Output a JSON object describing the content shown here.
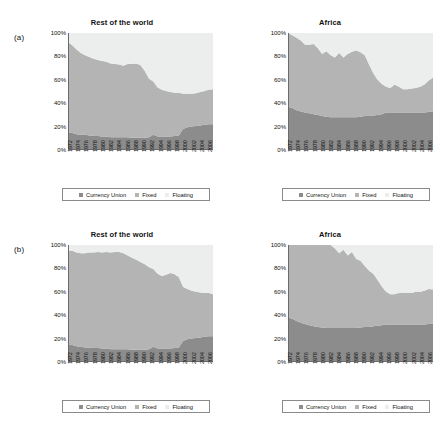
{
  "figure": {
    "panels": [
      {
        "letter": "(a)",
        "title": "Rest of the world",
        "position": "top-left"
      },
      {
        "letter": "",
        "title": "Africa",
        "position": "top-right"
      },
      {
        "letter": "(b)",
        "title": "Rest of the world",
        "position": "bottom-left"
      },
      {
        "letter": "",
        "title": "Africa",
        "position": "bottom-right"
      }
    ],
    "legend": {
      "items": [
        {
          "label": "Currency Union",
          "color": "#8c8c8c",
          "swatch": "square-marker"
        },
        {
          "label": "Fixed",
          "color": "#b4b4b4",
          "swatch": "square-marker"
        },
        {
          "label": "Floating",
          "color": "#eceded",
          "swatch": "square-marker"
        }
      ]
    },
    "yticks": [
      "100%",
      "80%",
      "60%",
      "40%",
      "20%",
      "0%"
    ],
    "xticks": [
      "1972",
      "1974",
      "1976",
      "1978",
      "1980",
      "1982",
      "1984",
      "1986",
      "1988",
      "1990",
      "1992",
      "1994",
      "1996",
      "1998",
      "2000",
      "2002",
      "2004",
      "2006"
    ]
  },
  "chart_data": [
    {
      "id": "panel-a-rest-of-the-world",
      "type": "area",
      "stacked": true,
      "title": "Rest of the world",
      "panel_letter": "(a)",
      "xlabel": "",
      "ylabel": "",
      "ylim": [
        0,
        100
      ],
      "grid": false,
      "legend_position": "bottom",
      "x": [
        1972,
        1973,
        1974,
        1975,
        1976,
        1977,
        1978,
        1979,
        1980,
        1981,
        1982,
        1983,
        1984,
        1985,
        1986,
        1987,
        1988,
        1989,
        1990,
        1991,
        1992,
        1993,
        1994,
        1995,
        1996,
        1997,
        1998,
        1999,
        2000,
        2001,
        2002,
        2003,
        2004,
        2005,
        2006
      ],
      "series": [
        {
          "name": "Currency Union",
          "color": "#8c8c8c",
          "values": [
            15,
            14.5,
            13.5,
            13,
            13,
            12.5,
            12,
            12,
            11.5,
            11.5,
            11,
            11,
            11,
            11,
            11,
            10.5,
            10.5,
            10.5,
            10.5,
            11,
            13,
            11.5,
            11.5,
            11.5,
            11.5,
            12,
            12.5,
            18,
            19.5,
            20,
            20.5,
            21,
            21.5,
            22,
            22
          ]
        },
        {
          "name": "Fixed",
          "color": "#b4b4b4",
          "values": [
            77,
            75,
            72.5,
            70,
            68,
            67,
            66,
            65,
            64.5,
            64,
            63,
            62.5,
            62,
            61,
            62.5,
            63,
            63.5,
            62,
            57,
            50,
            45.5,
            42,
            40,
            39,
            38,
            37,
            36.5,
            30,
            28.5,
            28,
            28,
            28.5,
            29,
            29.5,
            30
          ]
        },
        {
          "name": "Floating",
          "color": "#eceded",
          "values": [
            8,
            10.5,
            14,
            17,
            19,
            20.5,
            22,
            23,
            24,
            24.5,
            26,
            26.5,
            27,
            28,
            26.5,
            26.5,
            26,
            27.5,
            32.5,
            39,
            41.5,
            46.5,
            48.5,
            49.5,
            50.5,
            51,
            51,
            52,
            52,
            52,
            51.5,
            50.5,
            49.5,
            48.5,
            48
          ]
        }
      ]
    },
    {
      "id": "panel-a-africa",
      "type": "area",
      "stacked": true,
      "title": "Africa",
      "panel_letter": "",
      "xlabel": "",
      "ylabel": "",
      "ylim": [
        0,
        100
      ],
      "grid": false,
      "legend_position": "bottom",
      "x": [
        1972,
        1973,
        1974,
        1975,
        1976,
        1977,
        1978,
        1979,
        1980,
        1981,
        1982,
        1983,
        1984,
        1985,
        1986,
        1987,
        1988,
        1989,
        1990,
        1991,
        1992,
        1993,
        1994,
        1995,
        1996,
        1997,
        1998,
        1999,
        2000,
        2001,
        2002,
        2003,
        2004,
        2005,
        2006
      ],
      "series": [
        {
          "name": "Currency Union",
          "color": "#8c8c8c",
          "values": [
            37,
            36,
            34,
            33,
            32,
            31.5,
            30.5,
            30,
            29,
            28.5,
            28,
            28,
            28,
            28,
            28,
            28,
            28,
            28.5,
            29,
            29,
            29.5,
            30,
            30.5,
            32,
            32,
            32,
            32,
            32,
            32,
            32,
            32,
            32,
            32,
            32.5,
            33
          ]
        },
        {
          "name": "Fixed",
          "color": "#b4b4b4",
          "values": [
            63,
            62,
            62,
            60.5,
            58,
            58.5,
            60,
            57,
            53,
            56,
            53,
            51,
            55,
            51,
            54,
            56,
            57,
            55,
            52,
            44,
            36,
            30,
            26,
            22,
            21,
            24,
            22,
            20,
            20,
            20.5,
            21,
            22,
            24,
            27,
            29
          ]
        },
        {
          "name": "Floating",
          "color": "#eceded",
          "values": [
            0,
            2,
            4,
            6.5,
            10,
            10,
            9.5,
            13,
            18,
            15.5,
            19,
            21,
            17,
            21,
            18,
            16,
            15,
            16.5,
            19,
            27,
            34.5,
            40,
            43.5,
            46,
            47,
            44,
            46,
            48,
            48,
            47.5,
            47,
            46,
            44,
            40.5,
            38
          ]
        }
      ]
    },
    {
      "id": "panel-b-rest-of-the-world",
      "type": "area",
      "stacked": true,
      "title": "Rest of the world",
      "panel_letter": "(b)",
      "xlabel": "",
      "ylabel": "",
      "ylim": [
        0,
        100
      ],
      "grid": false,
      "legend_position": "bottom",
      "x": [
        1972,
        1973,
        1974,
        1975,
        1976,
        1977,
        1978,
        1979,
        1980,
        1981,
        1982,
        1983,
        1984,
        1985,
        1986,
        1987,
        1988,
        1989,
        1990,
        1991,
        1992,
        1993,
        1994,
        1995,
        1996,
        1997,
        1998,
        1999,
        2000,
        2001,
        2002,
        2003,
        2004,
        2005,
        2006
      ],
      "series": [
        {
          "name": "Currency Union",
          "color": "#8c8c8c",
          "values": [
            15,
            14.5,
            13.5,
            13,
            12.5,
            12.5,
            12,
            12,
            11.5,
            11.5,
            11,
            11,
            11,
            11,
            11,
            10.5,
            10.5,
            10.5,
            10.5,
            11,
            13,
            11.5,
            11.5,
            11.5,
            11.5,
            12,
            12.5,
            18,
            19.5,
            20,
            20.5,
            21,
            21.5,
            22,
            22
          ]
        },
        {
          "name": "Fixed",
          "color": "#b4b4b4",
          "values": [
            80,
            80.5,
            80,
            80,
            80.5,
            81,
            81.5,
            82,
            82,
            82.5,
            82.5,
            83,
            83,
            82,
            80,
            78.5,
            77,
            75,
            73,
            70,
            66.5,
            64,
            62,
            63,
            64.5,
            63,
            60,
            46,
            43,
            41,
            39.5,
            38.5,
            37.5,
            37,
            36
          ]
        },
        {
          "name": "Floating",
          "color": "#eceded",
          "values": [
            5,
            5,
            6.5,
            7,
            7,
            6.5,
            6.5,
            6,
            6.5,
            6,
            6.5,
            6,
            6,
            7,
            9,
            11,
            12.5,
            14.5,
            16.5,
            19,
            20.5,
            24.5,
            26.5,
            25.5,
            24,
            25,
            27.5,
            36,
            37.5,
            39,
            40,
            40.5,
            41,
            41,
            42
          ]
        }
      ]
    },
    {
      "id": "panel-b-africa",
      "type": "area",
      "stacked": true,
      "title": "Africa",
      "panel_letter": "",
      "xlabel": "",
      "ylabel": "",
      "ylim": [
        0,
        100
      ],
      "grid": false,
      "legend_position": "bottom",
      "x": [
        1972,
        1973,
        1974,
        1975,
        1976,
        1977,
        1978,
        1979,
        1980,
        1981,
        1982,
        1983,
        1984,
        1985,
        1986,
        1987,
        1988,
        1989,
        1990,
        1991,
        1992,
        1993,
        1994,
        1995,
        1996,
        1997,
        1998,
        1999,
        2000,
        2001,
        2002,
        2003,
        2004,
        2005,
        2006
      ],
      "series": [
        {
          "name": "Currency Union",
          "color": "#8c8c8c",
          "values": [
            38,
            37,
            35,
            33.5,
            32.5,
            31.5,
            30.5,
            30,
            29.5,
            29,
            29,
            29,
            29,
            29,
            29,
            29,
            29,
            29.5,
            30,
            30,
            30.5,
            31,
            31.5,
            32,
            32,
            32,
            32,
            32,
            32,
            32,
            32,
            32,
            32,
            32.5,
            33
          ]
        },
        {
          "name": "Fixed",
          "color": "#b4b4b4",
          "values": [
            62,
            63,
            65,
            66.5,
            67.5,
            68.5,
            69.5,
            70,
            70.5,
            71,
            71,
            68,
            64,
            67,
            62,
            65,
            59,
            57,
            52,
            48,
            45,
            39,
            33,
            28,
            26,
            26,
            27,
            27,
            27,
            27,
            28,
            28,
            29,
            30,
            29
          ]
        },
        {
          "name": "Floating",
          "color": "#eceded",
          "values": [
            0,
            0,
            0,
            0,
            0,
            0,
            0,
            0,
            0,
            0,
            0,
            3,
            7,
            4,
            9,
            6,
            12,
            13.5,
            18,
            22,
            24.5,
            30,
            35.5,
            40,
            42,
            42,
            41,
            41,
            41,
            41,
            40,
            40,
            39,
            37.5,
            38
          ]
        }
      ]
    }
  ]
}
